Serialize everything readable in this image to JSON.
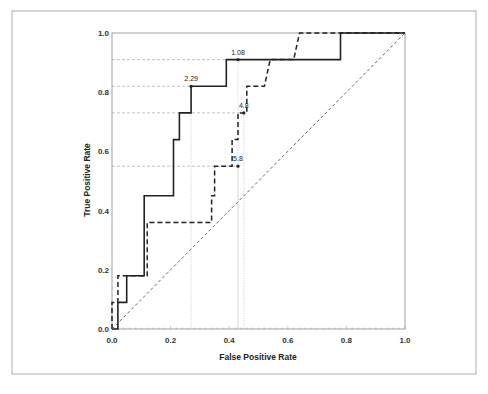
{
  "chart_data": {
    "type": "line",
    "title": "",
    "xlabel": "False Positive Rate",
    "ylabel": "True Positive Rate",
    "xlim": [
      0.0,
      1.0
    ],
    "ylim": [
      0.0,
      1.0
    ],
    "x_ticks": [
      "0.0",
      "0.2",
      "0.4",
      "0.6",
      "0.8",
      "1.0"
    ],
    "y_ticks": [
      "0.0",
      "0.2",
      "0.4",
      "0.6",
      "0.8",
      "1.0"
    ],
    "grid": false,
    "legend": null,
    "series": [
      {
        "name": "solid",
        "style": "solid",
        "points": [
          [
            0,
            0
          ],
          [
            0.02,
            0
          ],
          [
            0.02,
            0.09
          ],
          [
            0.05,
            0.09
          ],
          [
            0.05,
            0.18
          ],
          [
            0.11,
            0.18
          ],
          [
            0.11,
            0.45
          ],
          [
            0.21,
            0.45
          ],
          [
            0.21,
            0.64
          ],
          [
            0.23,
            0.64
          ],
          [
            0.23,
            0.73
          ],
          [
            0.27,
            0.73
          ],
          [
            0.27,
            0.82
          ],
          [
            0.39,
            0.82
          ],
          [
            0.39,
            0.91
          ],
          [
            0.78,
            0.91
          ],
          [
            0.78,
            1.0
          ],
          [
            1.0,
            1.0
          ]
        ]
      },
      {
        "name": "dashed",
        "style": "dashed",
        "points": [
          [
            0,
            0
          ],
          [
            0,
            0.09
          ],
          [
            0.02,
            0.09
          ],
          [
            0.02,
            0.18
          ],
          [
            0.12,
            0.18
          ],
          [
            0.12,
            0.36
          ],
          [
            0.34,
            0.36
          ],
          [
            0.34,
            0.45
          ],
          [
            0.35,
            0.45
          ],
          [
            0.35,
            0.55
          ],
          [
            0.41,
            0.55
          ],
          [
            0.41,
            0.64
          ],
          [
            0.43,
            0.64
          ],
          [
            0.43,
            0.73
          ],
          [
            0.46,
            0.73
          ],
          [
            0.46,
            0.82
          ],
          [
            0.52,
            0.82
          ],
          [
            0.54,
            0.91
          ],
          [
            0.62,
            0.91
          ],
          [
            0.64,
            1.0
          ],
          [
            1.0,
            1.0
          ]
        ]
      },
      {
        "name": "chance",
        "style": "dotted",
        "points": [
          [
            0,
            0
          ],
          [
            1,
            1
          ]
        ]
      }
    ],
    "annotations": [
      {
        "label": "2.29",
        "x": 0.27,
        "y": 0.82
      },
      {
        "label": "1.08",
        "x": 0.43,
        "y": 0.91
      },
      {
        "label": "4.8",
        "x": 0.45,
        "y": 0.73
      },
      {
        "label": "5.8",
        "x": 0.43,
        "y": 0.55
      }
    ]
  }
}
